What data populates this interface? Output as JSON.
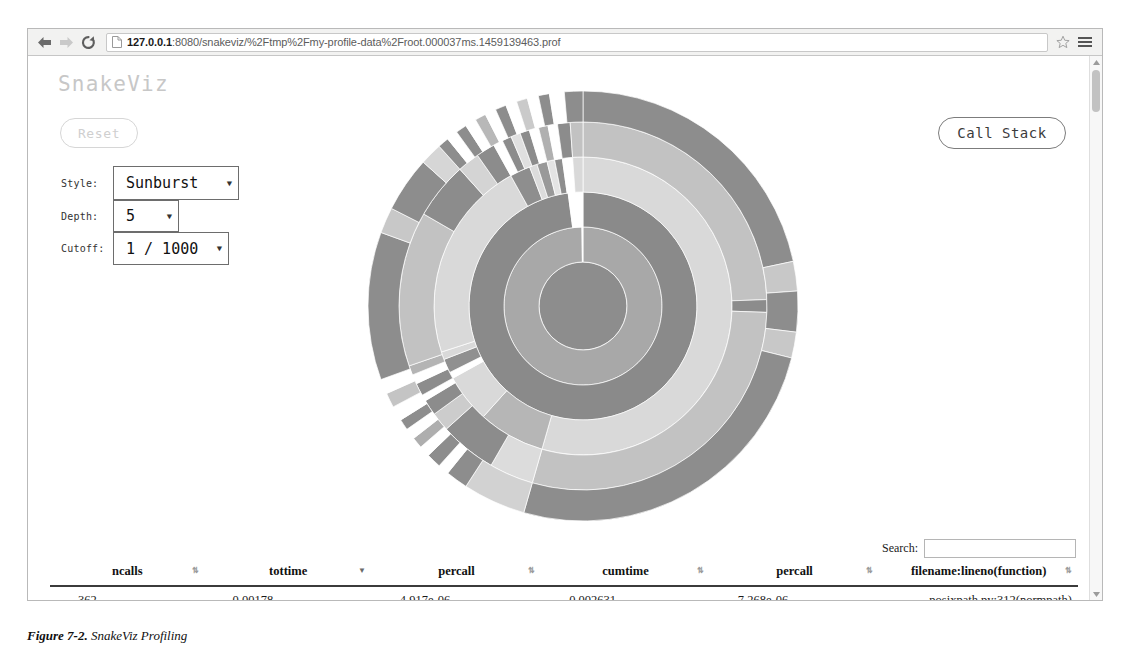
{
  "browser": {
    "back_icon": "back-arrow-icon",
    "forward_icon": "forward-arrow-icon",
    "reload_icon": "reload-icon",
    "page_icon": "page-document-icon",
    "url_host": "127.0.0.1",
    "url_path": ":8080/snakeviz/%2Ftmp%2Fmy-profile-data%2Froot.000037ms.1459139463.prof",
    "url_full": "127.0.0.1:8080/snakeviz/%2Ftmp%2Fmy-profile-data%2Froot.000037ms.1459139463.prof",
    "star_icon": "bookmark-star-icon",
    "menu_icon": "hamburger-menu-icon"
  },
  "app": {
    "title": "SnakeViz",
    "reset_label": "Reset",
    "call_stack_label": "Call Stack"
  },
  "controls": {
    "style": {
      "label": "Style:",
      "value": "Sunburst",
      "options": [
        "Sunburst",
        "Icicle"
      ]
    },
    "depth": {
      "label": "Depth:",
      "value": "5",
      "options": [
        "1",
        "2",
        "3",
        "4",
        "5",
        "6",
        "7",
        "8",
        "9",
        "10"
      ]
    },
    "cutoff": {
      "label": "Cutoff:",
      "value": "1 / 1000",
      "options": [
        "1 / 1000",
        "1 / 100",
        "1 / 10",
        "None"
      ]
    }
  },
  "search": {
    "label": "Search:",
    "value": "",
    "placeholder": ""
  },
  "table": {
    "columns": [
      {
        "label": "ncalls",
        "sort": "none"
      },
      {
        "label": "tottime",
        "sort": "desc"
      },
      {
        "label": "percall",
        "sort": "none"
      },
      {
        "label": "cumtime",
        "sort": "none"
      },
      {
        "label": "percall",
        "sort": "none"
      },
      {
        "label": "filename:lineno(function)",
        "sort": "none"
      }
    ],
    "rows": [
      {
        "ncalls": "362",
        "tottime": "0.00178",
        "percall1": "4.917e-06",
        "cumtime": "0.002631",
        "percall2": "7.268e-06",
        "filename": "posixpath.py:312(normpath)"
      }
    ]
  },
  "caption": {
    "number": "Figure 7-2.",
    "text": "SnakeViz Profiling"
  },
  "chart_data": {
    "type": "pie",
    "subtype": "sunburst",
    "depth": 5,
    "cutoff": "1/1000",
    "center_x": 230,
    "center_y": 230,
    "ring_radii": [
      0,
      44,
      79,
      114,
      149,
      184,
      215
    ],
    "palette": {
      "dark": "#8d8d8d",
      "mid": "#a8a8a8",
      "light": "#cfcfcf",
      "lightest": "#e2e2e2",
      "gap": "#ffffff"
    },
    "rings": [
      {
        "ring": 0,
        "r_inner": 0,
        "r_outer": 44,
        "segments": [
          {
            "start": 0,
            "end": 360,
            "color": "#8d8d8d"
          }
        ]
      },
      {
        "ring": 1,
        "r_inner": 44,
        "r_outer": 79,
        "segments": [
          {
            "start": 0,
            "end": 359.2,
            "color": "#a8a8a8"
          },
          {
            "start": 359.2,
            "end": 360,
            "color": "#ffffff"
          }
        ]
      },
      {
        "ring": 2,
        "r_inner": 79,
        "r_outer": 114,
        "segments": [
          {
            "start": 0,
            "end": 352.5,
            "color": "#8a8a8a"
          },
          {
            "start": 352.5,
            "end": 360,
            "color": "#ffffff"
          }
        ]
      },
      {
        "ring": 3,
        "r_inner": 114,
        "r_outer": 149,
        "segments": [
          {
            "start": 0,
            "end": 196,
            "color": "#d9d9d9"
          },
          {
            "start": 196,
            "end": 222,
            "color": "#b6b6b6"
          },
          {
            "start": 222,
            "end": 241,
            "color": "#d9d9d9"
          },
          {
            "start": 241,
            "end": 243.5,
            "color": "#ffffff"
          },
          {
            "start": 243.5,
            "end": 249,
            "color": "#909090"
          },
          {
            "start": 249,
            "end": 252,
            "color": "#d9d9d9"
          },
          {
            "start": 252,
            "end": 331,
            "color": "#d9d9d9"
          },
          {
            "start": 331,
            "end": 339,
            "color": "#8e8e8e"
          },
          {
            "start": 339,
            "end": 342,
            "color": "#dcdcdc"
          },
          {
            "start": 342,
            "end": 346,
            "color": "#999999"
          },
          {
            "start": 346,
            "end": 349,
            "color": "#e4e4e4"
          },
          {
            "start": 349,
            "end": 352,
            "color": "#8e8e8e"
          },
          {
            "start": 352,
            "end": 356,
            "color": "#ffffff"
          },
          {
            "start": 356,
            "end": 360,
            "color": "#d9d9d9"
          }
        ]
      },
      {
        "ring": 4,
        "r_inner": 149,
        "r_outer": 184,
        "segments": [
          {
            "start": 0,
            "end": 88,
            "color": "#c2c2c2"
          },
          {
            "start": 88,
            "end": 92,
            "color": "#8c8c8c"
          },
          {
            "start": 92,
            "end": 196,
            "color": "#c2c2c2"
          },
          {
            "start": 196,
            "end": 210,
            "color": "#dcdcdc"
          },
          {
            "start": 210,
            "end": 228,
            "color": "#8c8c8c"
          },
          {
            "start": 228,
            "end": 234,
            "color": "#cccccc"
          },
          {
            "start": 234,
            "end": 239,
            "color": "#8c8c8c"
          },
          {
            "start": 239,
            "end": 241,
            "color": "#ffffff"
          },
          {
            "start": 241,
            "end": 245,
            "color": "#8c8c8c"
          },
          {
            "start": 245,
            "end": 248,
            "color": "#ffffff"
          },
          {
            "start": 248,
            "end": 251,
            "color": "#b4b4b4"
          },
          {
            "start": 251,
            "end": 300,
            "color": "#c2c2c2"
          },
          {
            "start": 300,
            "end": 318,
            "color": "#8c8c8c"
          },
          {
            "start": 318,
            "end": 325,
            "color": "#d4d4d4"
          },
          {
            "start": 325,
            "end": 331,
            "color": "#8c8c8c"
          },
          {
            "start": 331,
            "end": 334,
            "color": "#ffffff"
          },
          {
            "start": 334,
            "end": 337,
            "color": "#8c8c8c"
          },
          {
            "start": 337,
            "end": 340,
            "color": "#e0e0e0"
          },
          {
            "start": 340,
            "end": 343,
            "color": "#8c8c8c"
          },
          {
            "start": 343,
            "end": 346,
            "color": "#ffffff"
          },
          {
            "start": 346,
            "end": 349,
            "color": "#b0b0b0"
          },
          {
            "start": 349,
            "end": 352,
            "color": "#ffffff"
          },
          {
            "start": 352,
            "end": 356,
            "color": "#8c8c8c"
          },
          {
            "start": 356,
            "end": 360,
            "color": "#c2c2c2"
          }
        ]
      },
      {
        "ring": 5,
        "r_inner": 184,
        "r_outer": 215,
        "segments": [
          {
            "start": 0,
            "end": 78,
            "color": "#8d8d8d"
          },
          {
            "start": 78,
            "end": 86,
            "color": "#c8c8c8"
          },
          {
            "start": 86,
            "end": 97,
            "color": "#8d8d8d"
          },
          {
            "start": 97,
            "end": 104,
            "color": "#c8c8c8"
          },
          {
            "start": 104,
            "end": 196,
            "color": "#8d8d8d"
          },
          {
            "start": 196,
            "end": 213,
            "color": "#d2d2d2"
          },
          {
            "start": 213,
            "end": 219,
            "color": "#8d8d8d"
          },
          {
            "start": 219,
            "end": 222,
            "color": "#ffffff"
          },
          {
            "start": 222,
            "end": 226,
            "color": "#8d8d8d"
          },
          {
            "start": 226,
            "end": 229,
            "color": "#ffffff"
          },
          {
            "start": 229,
            "end": 232,
            "color": "#aeaeae"
          },
          {
            "start": 232,
            "end": 235,
            "color": "#ffffff"
          },
          {
            "start": 235,
            "end": 238,
            "color": "#8d8d8d"
          },
          {
            "start": 238,
            "end": 242,
            "color": "#ffffff"
          },
          {
            "start": 242,
            "end": 246,
            "color": "#c4c4c4"
          },
          {
            "start": 246,
            "end": 250,
            "color": "#ffffff"
          },
          {
            "start": 250,
            "end": 290,
            "color": "#8d8d8d"
          },
          {
            "start": 290,
            "end": 297,
            "color": "#c8c8c8"
          },
          {
            "start": 297,
            "end": 312,
            "color": "#8d8d8d"
          },
          {
            "start": 312,
            "end": 318,
            "color": "#d6d6d6"
          },
          {
            "start": 318,
            "end": 321,
            "color": "#8d8d8d"
          },
          {
            "start": 321,
            "end": 324,
            "color": "#ffffff"
          },
          {
            "start": 324,
            "end": 327,
            "color": "#8d8d8d"
          },
          {
            "start": 327,
            "end": 330,
            "color": "#ffffff"
          },
          {
            "start": 330,
            "end": 333,
            "color": "#b8b8b8"
          },
          {
            "start": 333,
            "end": 336,
            "color": "#ffffff"
          },
          {
            "start": 336,
            "end": 339,
            "color": "#8d8d8d"
          },
          {
            "start": 339,
            "end": 342,
            "color": "#ffffff"
          },
          {
            "start": 342,
            "end": 345,
            "color": "#cacaca"
          },
          {
            "start": 345,
            "end": 348,
            "color": "#ffffff"
          },
          {
            "start": 348,
            "end": 351,
            "color": "#8d8d8d"
          },
          {
            "start": 351,
            "end": 355,
            "color": "#ffffff"
          },
          {
            "start": 355,
            "end": 360,
            "color": "#8d8d8d"
          }
        ]
      }
    ]
  }
}
